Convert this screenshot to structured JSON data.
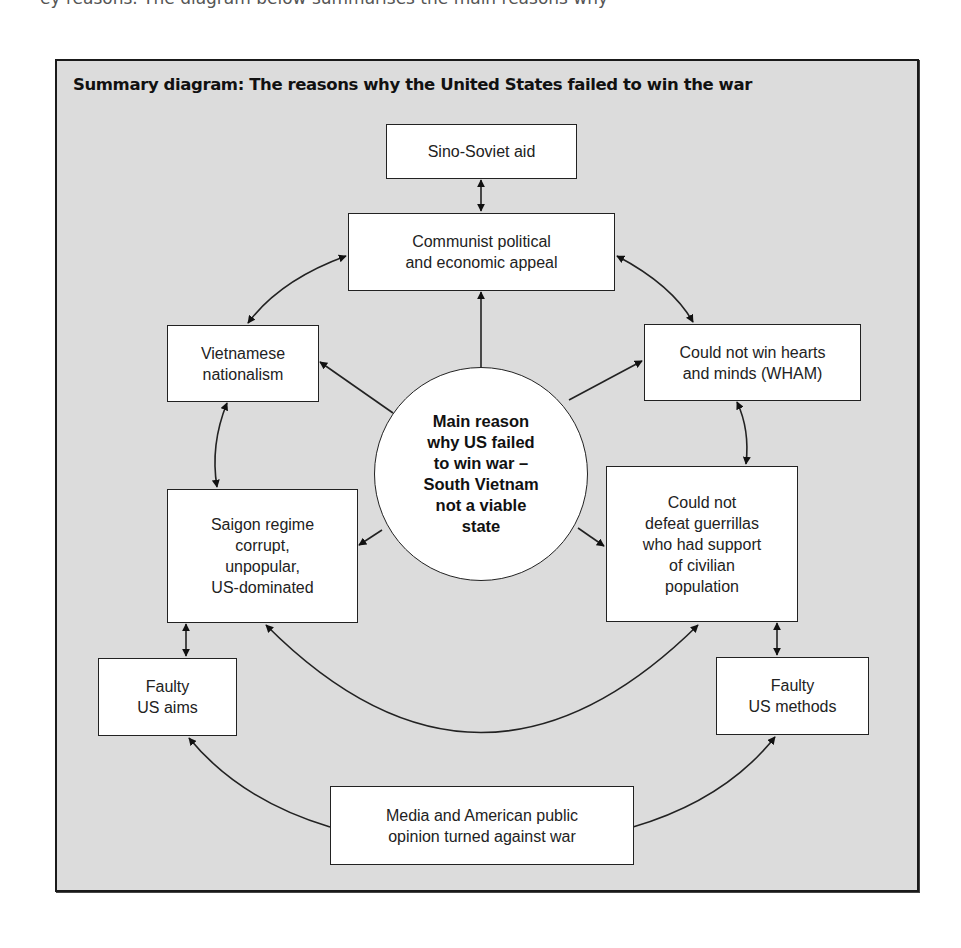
{
  "page": {
    "cropped_top_text": "ey reasons. The diagram below summarises the main reasons why"
  },
  "diagram": {
    "title": "Summary diagram: The reasons why the United States failed to win the war",
    "center": {
      "label": "Main reason\nwhy US failed\nto win war –\nSouth Vietnam\nnot a viable\nstate"
    },
    "nodes": {
      "sino_soviet": "Sino-Soviet aid",
      "communist_appeal": "Communist political\nand economic appeal",
      "nationalism": "Vietnamese\nnationalism",
      "wham": "Could not win hearts\nand minds (WHAM)",
      "saigon": "Saigon regime\ncorrupt,\nunpopular,\nUS-dominated",
      "guerrillas": "Could not\ndefeat guerrillas\nwho had support\nof civilian\npopulation",
      "faulty_aims": "Faulty\nUS aims",
      "faulty_methods": "Faulty\nUS methods",
      "media": "Media and American public\nopinion turned against war"
    },
    "edges": [
      {
        "from": "sino_soviet",
        "to": "communist_appeal",
        "type": "bidirectional"
      },
      {
        "from": "center",
        "to": "communist_appeal",
        "type": "directed"
      },
      {
        "from": "center",
        "to": "nationalism",
        "type": "directed"
      },
      {
        "from": "center",
        "to": "wham",
        "type": "directed"
      },
      {
        "from": "center",
        "to": "saigon",
        "type": "directed"
      },
      {
        "from": "center",
        "to": "guerrillas",
        "type": "directed"
      },
      {
        "from": "communist_appeal",
        "to": "nationalism",
        "type": "bidirectional"
      },
      {
        "from": "communist_appeal",
        "to": "wham",
        "type": "bidirectional"
      },
      {
        "from": "nationalism",
        "to": "saigon",
        "type": "bidirectional"
      },
      {
        "from": "wham",
        "to": "guerrillas",
        "type": "bidirectional"
      },
      {
        "from": "saigon",
        "to": "guerrillas",
        "type": "bidirectional"
      },
      {
        "from": "saigon",
        "to": "faulty_aims",
        "type": "bidirectional"
      },
      {
        "from": "guerrillas",
        "to": "faulty_methods",
        "type": "bidirectional"
      },
      {
        "from": "media",
        "to": "faulty_aims",
        "type": "directed"
      },
      {
        "from": "media",
        "to": "faulty_methods",
        "type": "directed"
      }
    ],
    "colors": {
      "background": "#dcdcdc",
      "box_fill": "#ffffff",
      "stroke": "#222222"
    }
  }
}
